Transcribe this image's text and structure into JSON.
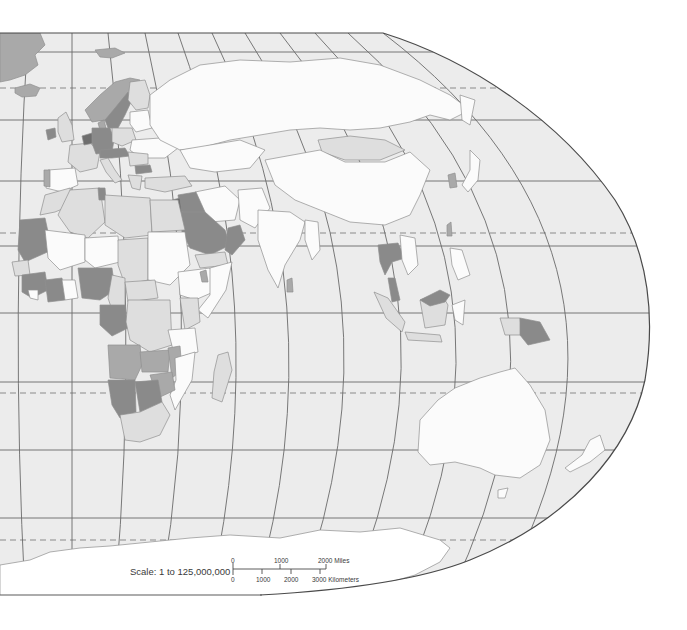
{
  "map": {
    "region": "Eastern Hemisphere — Europe, Africa, Asia, Oceania",
    "projection": "Robinson (east half)",
    "colors": {
      "sea": "#ececec",
      "land_white": "#fbfbfb",
      "land_light": "#dedede",
      "land_medium": "#a9a9a9",
      "land_dark": "#8a8a8a",
      "land_darkest": "#6e6e6e",
      "graticule": "#6a6a6a",
      "frame": "#4a4a4a"
    },
    "graticule": {
      "parallels_solid_y": [
        52,
        120,
        181,
        246,
        313,
        382,
        450,
        518
      ],
      "parallels_dashed_y": [
        88,
        233,
        393,
        540
      ],
      "dashed_labels": [
        "Arctic Circle",
        "Tropic of Cancer",
        "Tropic of Capricorn",
        "Antarctic Circle"
      ]
    }
  },
  "scale": {
    "label": "Scale:  1 to 125,000,000",
    "miles": {
      "ticks": [
        "0",
        "1000",
        "2000 Miles"
      ]
    },
    "kilometers": {
      "ticks": [
        "0",
        "1000",
        "2000",
        "3000 Kilometers"
      ]
    }
  }
}
